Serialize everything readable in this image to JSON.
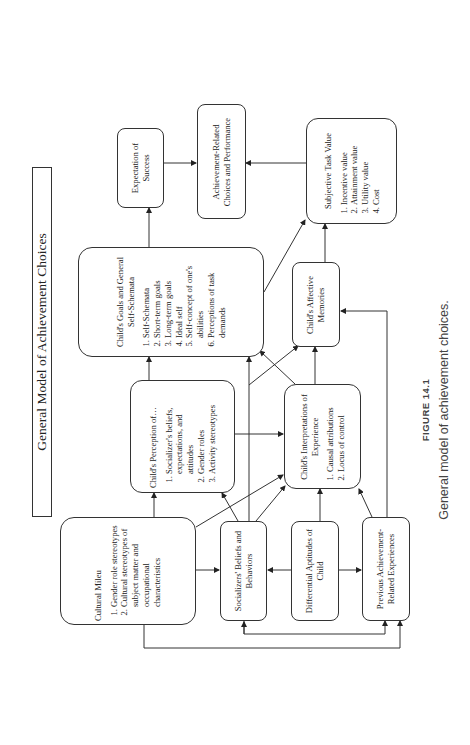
{
  "diagram": {
    "title": "General Model of Achievement Choices",
    "orientation": "rotated-90-ccw",
    "nodes": {
      "expectation": {
        "label": "Expectation of Success"
      },
      "choices": {
        "label": "Achievement-Related Choices and Performance"
      },
      "task_value": {
        "label": "Subjective Task Value",
        "items": [
          "Incentive value",
          "Attainment value",
          "Utility value",
          "Cost"
        ]
      },
      "goals": {
        "label": "Child's Goals and General Self-Schemata",
        "items": [
          "Self-Schemata",
          "Short-term goals",
          "Long-term goals",
          "Ideal self",
          "Self-concept of one's abilities",
          "Perceptions of task demands"
        ]
      },
      "affective": {
        "label": "Child's Affective Memories"
      },
      "perception": {
        "label": "Child's Perception of…",
        "items": [
          "Socializer's beliefs, expectations, and attitudes",
          "Gender roles",
          "Activity stereotypes"
        ]
      },
      "interpretations": {
        "label": "Child's Interpretations of Experience",
        "items": [
          "Causal attributions",
          "Locus of control"
        ]
      },
      "cultural": {
        "label": "Cultural Mileu",
        "items": [
          "Gender role stereotypes",
          "Cultural stereotypes of subject matter and occupational characteristics"
        ]
      },
      "socializers": {
        "label": "Socializers' Beliefs and Behaviors"
      },
      "aptitudes": {
        "label": "Differential Aptitudes of Child"
      },
      "previous": {
        "label": "Previous Achievement-Related Experiences"
      }
    },
    "edges": [
      [
        "expectation",
        "choices"
      ],
      [
        "task_value",
        "choices"
      ],
      [
        "goals",
        "expectation"
      ],
      [
        "goals",
        "task_value"
      ],
      [
        "affective",
        "task_value"
      ],
      [
        "perception",
        "goals"
      ],
      [
        "perception",
        "interpretations"
      ],
      [
        "interpretations",
        "goals"
      ],
      [
        "interpretations",
        "affective"
      ],
      [
        "socializers",
        "perception"
      ],
      [
        "socializers",
        "goals"
      ],
      [
        "socializers",
        "affective"
      ],
      [
        "socializers",
        "interpretations"
      ],
      [
        "cultural",
        "perception"
      ],
      [
        "cultural",
        "socializers"
      ],
      [
        "cultural",
        "interpretations"
      ],
      [
        "cultural",
        "previous"
      ],
      [
        "aptitudes",
        "socializers"
      ],
      [
        "aptitudes",
        "previous"
      ],
      [
        "aptitudes",
        "interpretations"
      ],
      [
        "previous",
        "interpretations"
      ],
      [
        "previous",
        "affective"
      ],
      [
        "previous",
        "socializers"
      ]
    ]
  },
  "caption": {
    "figure_label": "FIGURE 14.1",
    "text": "General model of achievement choices."
  }
}
